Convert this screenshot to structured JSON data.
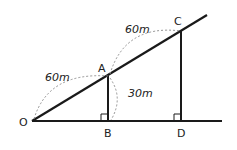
{
  "diagram": {
    "points": {
      "O": {
        "label": "O",
        "x": 32,
        "y": 121
      },
      "A": {
        "label": "A",
        "x": 108,
        "y": 76
      },
      "B": {
        "label": "B",
        "x": 108,
        "y": 121
      },
      "C": {
        "label": "C",
        "x": 181,
        "y": 31
      },
      "D": {
        "label": "D",
        "x": 181,
        "y": 121
      }
    },
    "measures": {
      "OA": "60m",
      "AC": "60m",
      "AB": "30m"
    },
    "colors": {
      "line": "#1a1a1a",
      "dashed": "#888888"
    }
  }
}
